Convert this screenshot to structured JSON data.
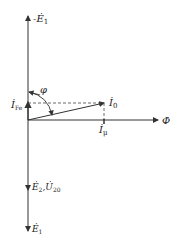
{
  "diagram": {
    "type": "phasor-diagram",
    "labels": {
      "neg_e1": "-Ė",
      "neg_e1_sub": "1",
      "phi_angle": "φ",
      "i_fe": "İ",
      "i_fe_sub": "Fe",
      "i0": "İ",
      "i0_sub": "0",
      "i_mu": "İ",
      "i_mu_sub": "μ",
      "flux": "Φ̇",
      "e2": "Ė",
      "e2_sub": "2",
      "u20_sep": ",",
      "u20": "U̇",
      "u20_sub": "20",
      "e1": "Ė",
      "e1_sub": "1"
    },
    "colors": {
      "line": "#333333",
      "dashed": "#444444"
    }
  }
}
